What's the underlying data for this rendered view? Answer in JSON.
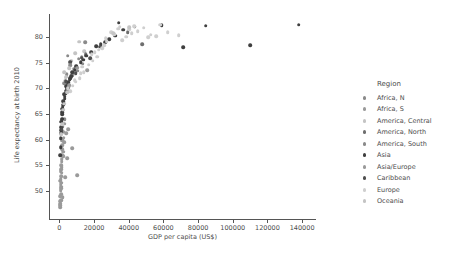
{
  "chart_data": {
    "type": "scatter",
    "title": "",
    "xlabel": "GDP per capita (US$)",
    "ylabel": "Life expectancy at birth 2010",
    "xlim": [
      -6000,
      148000
    ],
    "ylim": [
      44.5,
      84.5
    ],
    "xticks": [
      0,
      20000,
      40000,
      60000,
      80000,
      100000,
      120000,
      140000
    ],
    "xticklabels": [
      "0",
      "20000",
      "40000",
      "60000",
      "80000",
      "100000",
      "120000",
      "140000"
    ],
    "yticks": [
      50,
      55,
      60,
      65,
      70,
      75,
      80
    ],
    "yticklabels": [
      "50",
      "55",
      "60",
      "65",
      "70",
      "75",
      "80"
    ],
    "grid": false,
    "legend": {
      "title": "Region",
      "position": "right",
      "entries": [
        {
          "label": "Africa, N",
          "color": "#8a8a8a"
        },
        {
          "label": "Africa, S",
          "color": "#9a9a9a"
        },
        {
          "label": "America, Central",
          "color": "#c4c4c4"
        },
        {
          "label": "America, North",
          "color": "#6e6e6e"
        },
        {
          "label": "America, South",
          "color": "#8a8a8a"
        },
        {
          "label": "Asia",
          "color": "#3f3f3f"
        },
        {
          "label": "Asia/Europe",
          "color": "#9a9a9a"
        },
        {
          "label": "Caribbean",
          "color": "#4f4f4f"
        },
        {
          "label": "Europe",
          "color": "#cfcfcf"
        },
        {
          "label": "Oceania",
          "color": "#c4c4c4"
        }
      ]
    },
    "series": [
      {
        "name": "Africa, N",
        "color": "#8a8a8a",
        "points": [
          [
            4200,
            72.8
          ],
          [
            8300,
            73.1
          ],
          [
            2900,
            71.0
          ],
          [
            6100,
            74.5
          ],
          [
            13500,
            74.8
          ],
          [
            1800,
            62.5
          ],
          [
            3100,
            64.0
          ]
        ]
      },
      {
        "name": "Africa, S",
        "color": "#9a9a9a",
        "points": [
          [
            1200,
            55.0
          ],
          [
            800,
            52.3
          ],
          [
            1500,
            58.1
          ],
          [
            2400,
            60.4
          ],
          [
            650,
            50.1
          ],
          [
            1900,
            48.7
          ],
          [
            3400,
            52.6
          ],
          [
            1100,
            54.2
          ],
          [
            540,
            47.5
          ],
          [
            980,
            49.3
          ],
          [
            1350,
            53.5
          ],
          [
            2100,
            56.8
          ],
          [
            700,
            51.2
          ],
          [
            1600,
            57.0
          ],
          [
            450,
            46.8
          ],
          [
            2800,
            59.5
          ],
          [
            890,
            50.8
          ],
          [
            1250,
            55.7
          ],
          [
            620,
            49.0
          ],
          [
            1750,
            58.9
          ],
          [
            3900,
            61.2
          ],
          [
            5100,
            62.0
          ],
          [
            10200,
            53.0
          ],
          [
            7400,
            58.3
          ],
          [
            1420,
            56.2
          ],
          [
            960,
            48.2
          ],
          [
            2250,
            57.6
          ],
          [
            1080,
            52.9
          ],
          [
            760,
            53.8
          ],
          [
            1580,
            59.8
          ],
          [
            410,
            48.0
          ],
          [
            2050,
            61.5
          ],
          [
            340,
            47.2
          ],
          [
            1330,
            54.6
          ],
          [
            880,
            51.6
          ],
          [
            4600,
            56.4
          ],
          [
            2700,
            63.1
          ],
          [
            1150,
            50.5
          ],
          [
            1900,
            60.1
          ],
          [
            630,
            52.0
          ]
        ]
      },
      {
        "name": "America, Central",
        "color": "#c4c4c4",
        "points": [
          [
            9100,
            76.8
          ],
          [
            4300,
            72.3
          ],
          [
            5800,
            73.9
          ],
          [
            3200,
            71.5
          ],
          [
            2600,
            73.2
          ],
          [
            11500,
            79.1
          ],
          [
            6900,
            75.4
          ],
          [
            14200,
            77.2
          ]
        ]
      },
      {
        "name": "America, North",
        "color": "#6e6e6e",
        "points": [
          [
            47800,
            78.6
          ],
          [
            39500,
            81.0
          ],
          [
            15100,
            76.7
          ]
        ]
      },
      {
        "name": "America, South",
        "color": "#8a8a8a",
        "points": [
          [
            11200,
            75.8
          ],
          [
            14800,
            79.0
          ],
          [
            10300,
            73.4
          ],
          [
            8700,
            73.8
          ],
          [
            4900,
            76.4
          ],
          [
            9600,
            74.1
          ],
          [
            7300,
            72.6
          ],
          [
            5400,
            70.2
          ],
          [
            12900,
            76.1
          ],
          [
            6200,
            75.0
          ]
        ]
      },
      {
        "name": "Asia",
        "color": "#3f3f3f",
        "points": [
          [
            7300,
            73.2
          ],
          [
            34200,
            82.8
          ],
          [
            32100,
            80.3
          ],
          [
            28700,
            79.6
          ],
          [
            4200,
            70.1
          ],
          [
            3100,
            68.4
          ],
          [
            1600,
            65.3
          ],
          [
            2400,
            67.2
          ],
          [
            5900,
            71.8
          ],
          [
            9800,
            74.3
          ],
          [
            1200,
            63.5
          ],
          [
            880,
            61.2
          ],
          [
            2100,
            66.8
          ],
          [
            15600,
            76.4
          ],
          [
            43500,
            82.0
          ],
          [
            21300,
            78.2
          ],
          [
            58900,
            82.3
          ],
          [
            3800,
            69.5
          ],
          [
            1450,
            64.1
          ],
          [
            760,
            60.3
          ],
          [
            6400,
            72.0
          ],
          [
            2950,
            68.0
          ],
          [
            1050,
            62.4
          ],
          [
            4700,
            70.8
          ],
          [
            18200,
            77.0
          ],
          [
            26400,
            79.0
          ],
          [
            12400,
            75.1
          ],
          [
            640,
            58.5
          ],
          [
            1780,
            66.0
          ],
          [
            3550,
            69.0
          ],
          [
            8900,
            73.6
          ],
          [
            5200,
            71.2
          ],
          [
            2300,
            67.5
          ],
          [
            1320,
            63.8
          ],
          [
            920,
            61.8
          ],
          [
            36800,
            81.4
          ],
          [
            71500,
            78.0
          ],
          [
            84300,
            82.2
          ],
          [
            110000,
            78.4
          ],
          [
            138000,
            82.4
          ],
          [
            2650,
            68.8
          ],
          [
            6800,
            72.4
          ],
          [
            1980,
            66.4
          ],
          [
            4050,
            70.4
          ],
          [
            13800,
            75.6
          ],
          [
            23900,
            78.6
          ],
          [
            560,
            57.0
          ],
          [
            1520,
            65.0
          ]
        ]
      },
      {
        "name": "Asia/Europe",
        "color": "#9a9a9a",
        "points": [
          [
            10400,
            74.0
          ],
          [
            16200,
            73.5
          ],
          [
            5600,
            70.6
          ]
        ]
      },
      {
        "name": "Caribbean",
        "color": "#4f4f4f",
        "points": [
          [
            9300,
            73.0
          ],
          [
            6100,
            75.2
          ],
          [
            12800,
            76.0
          ],
          [
            4400,
            69.8
          ],
          [
            1300,
            62.0
          ],
          [
            23400,
            78.1
          ],
          [
            17900,
            75.9
          ],
          [
            3600,
            71.4
          ]
        ]
      },
      {
        "name": "Europe",
        "color": "#cfcfcf",
        "points": [
          [
            45200,
            81.2
          ],
          [
            41800,
            80.8
          ],
          [
            38400,
            80.1
          ],
          [
            52600,
            80.5
          ],
          [
            36100,
            79.4
          ],
          [
            33900,
            81.6
          ],
          [
            29800,
            80.9
          ],
          [
            27200,
            79.2
          ],
          [
            24600,
            77.8
          ],
          [
            21900,
            76.2
          ],
          [
            19300,
            75.4
          ],
          [
            16800,
            74.6
          ],
          [
            14100,
            73.2
          ],
          [
            11700,
            72.0
          ],
          [
            9400,
            71.3
          ],
          [
            7600,
            70.5
          ],
          [
            62400,
            81.0
          ],
          [
            55800,
            80.2
          ],
          [
            48700,
            81.8
          ],
          [
            43100,
            82.1
          ],
          [
            31500,
            80.6
          ],
          [
            25900,
            78.4
          ],
          [
            20400,
            77.1
          ],
          [
            13200,
            74.2
          ],
          [
            8800,
            71.6
          ],
          [
            6300,
            69.4
          ],
          [
            4800,
            70.0
          ],
          [
            68900,
            80.4
          ],
          [
            34800,
            82.0
          ],
          [
            40300,
            81.5
          ],
          [
            26800,
            79.8
          ],
          [
            18600,
            76.6
          ],
          [
            22700,
            77.5
          ],
          [
            12300,
            73.0
          ],
          [
            58200,
            82.4
          ],
          [
            51300,
            80.0
          ]
        ]
      },
      {
        "name": "Oceania",
        "color": "#c4c4c4",
        "points": [
          [
            40100,
            81.9
          ],
          [
            31200,
            80.7
          ],
          [
            2900,
            67.0
          ],
          [
            1600,
            63.0
          ],
          [
            3700,
            72.2
          ],
          [
            2100,
            65.8
          ],
          [
            1150,
            61.0
          ],
          [
            4600,
            69.2
          ]
        ]
      }
    ]
  }
}
